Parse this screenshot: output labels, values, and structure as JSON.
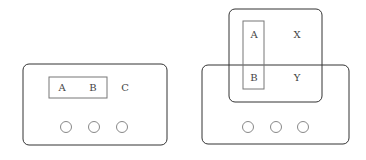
{
  "diagram": {
    "colors": {
      "stroke": "#333333",
      "inner_stroke": "#777777",
      "circle_stroke": "#888888",
      "text": "#444444"
    },
    "left_device": {
      "highlighted_group": [
        "A",
        "B"
      ],
      "labels": {
        "a": "A",
        "b": "B",
        "c": "C"
      },
      "buttons": 3
    },
    "right_device": {
      "overlay_labels": {
        "a": "A",
        "x": "X",
        "b": "B",
        "y": "Y"
      },
      "highlighted_group": [
        "A",
        "B"
      ],
      "buttons": 3
    }
  }
}
